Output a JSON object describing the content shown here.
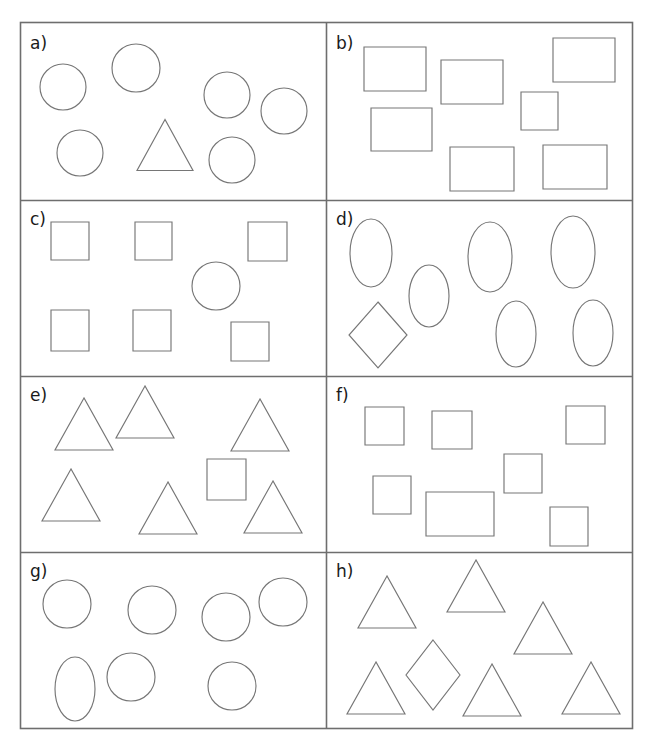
{
  "figure": {
    "title": "",
    "background_color": "#ffffff",
    "shape_stroke_color": "#767676",
    "frame_stroke_color": "#6e6e6e",
    "label_color": "#1a1a1a",
    "frame": {
      "x": 20,
      "y": 22,
      "width": 612,
      "height": 706
    },
    "dividers": {
      "vertical_x": [
        326
      ],
      "horizontal_y": [
        200,
        376,
        552
      ]
    }
  },
  "chart_data": {
    "type": "scatter",
    "title": "",
    "xlabel": "",
    "ylabel": "",
    "panels": [
      {
        "label": "a)",
        "label_pos": {
          "x": 30,
          "y": 49
        },
        "bounds": {
          "x": 20,
          "y": 22,
          "width": 306,
          "height": 178
        },
        "majority_shape": "circle",
        "majority_count": 6,
        "odd_shape": "triangle",
        "odd_count": 1,
        "shapes": [
          {
            "type": "circle",
            "cx": 63,
            "cy": 87,
            "r": 23
          },
          {
            "type": "circle",
            "cx": 136,
            "cy": 68,
            "r": 24
          },
          {
            "type": "circle",
            "cx": 227,
            "cy": 95,
            "r": 23
          },
          {
            "type": "circle",
            "cx": 284,
            "cy": 111,
            "r": 23
          },
          {
            "type": "circle",
            "cx": 80,
            "cy": 153,
            "r": 23
          },
          {
            "type": "circle",
            "cx": 232,
            "cy": 160,
            "r": 23
          },
          {
            "type": "triangle",
            "cx": 165,
            "cy": 145,
            "half_width": 28,
            "height": 51
          }
        ]
      },
      {
        "label": "b)",
        "label_pos": {
          "x": 336,
          "y": 49
        },
        "bounds": {
          "x": 326,
          "y": 22,
          "width": 306,
          "height": 178
        },
        "majority_shape": "rectangle",
        "majority_count": 6,
        "odd_shape": "square",
        "odd_count": 1,
        "shapes": [
          {
            "type": "rect",
            "x": 364,
            "y": 47,
            "width": 62,
            "height": 44
          },
          {
            "type": "rect",
            "x": 441,
            "y": 60,
            "width": 62,
            "height": 44
          },
          {
            "type": "rect",
            "x": 553,
            "y": 38,
            "width": 62,
            "height": 44
          },
          {
            "type": "rect",
            "x": 371,
            "y": 108,
            "width": 61,
            "height": 43
          },
          {
            "type": "rect",
            "x": 450,
            "y": 147,
            "width": 64,
            "height": 44
          },
          {
            "type": "rect",
            "x": 543,
            "y": 145,
            "width": 64,
            "height": 44
          },
          {
            "type": "rect",
            "x": 521,
            "y": 92,
            "width": 37,
            "height": 38
          }
        ]
      },
      {
        "label": "c)",
        "label_pos": {
          "x": 30,
          "y": 225
        },
        "bounds": {
          "x": 20,
          "y": 200,
          "width": 306,
          "height": 176
        },
        "majority_shape": "square",
        "majority_count": 6,
        "odd_shape": "circle",
        "odd_count": 1,
        "shapes": [
          {
            "type": "rect",
            "x": 51,
            "y": 222,
            "width": 38,
            "height": 38
          },
          {
            "type": "rect",
            "x": 135,
            "y": 222,
            "width": 37,
            "height": 38
          },
          {
            "type": "rect",
            "x": 248,
            "y": 222,
            "width": 39,
            "height": 39
          },
          {
            "type": "rect",
            "x": 51,
            "y": 310,
            "width": 38,
            "height": 41
          },
          {
            "type": "rect",
            "x": 133,
            "y": 310,
            "width": 38,
            "height": 41
          },
          {
            "type": "rect",
            "x": 231,
            "y": 322,
            "width": 38,
            "height": 39
          },
          {
            "type": "circle",
            "cx": 216,
            "cy": 286,
            "r": 24
          }
        ]
      },
      {
        "label": "d)",
        "label_pos": {
          "x": 336,
          "y": 225
        },
        "bounds": {
          "x": 326,
          "y": 200,
          "width": 306,
          "height": 176
        },
        "majority_shape": "ellipse",
        "majority_count": 6,
        "odd_shape": "diamond",
        "odd_count": 1,
        "shapes": [
          {
            "type": "ellipse",
            "cx": 371,
            "cy": 253,
            "rx": 21,
            "ry": 34
          },
          {
            "type": "ellipse",
            "cx": 429,
            "cy": 296,
            "rx": 20,
            "ry": 31
          },
          {
            "type": "ellipse",
            "cx": 490,
            "cy": 257,
            "rx": 22,
            "ry": 35
          },
          {
            "type": "ellipse",
            "cx": 573,
            "cy": 252,
            "rx": 22,
            "ry": 36
          },
          {
            "type": "ellipse",
            "cx": 516,
            "cy": 334,
            "rx": 20,
            "ry": 33
          },
          {
            "type": "ellipse",
            "cx": 593,
            "cy": 333,
            "rx": 20,
            "ry": 33
          },
          {
            "type": "diamond",
            "cx": 378,
            "cy": 335,
            "half_width": 29,
            "half_height": 33
          }
        ]
      },
      {
        "label": "e)",
        "label_pos": {
          "x": 30,
          "y": 401
        },
        "bounds": {
          "x": 20,
          "y": 376,
          "width": 306,
          "height": 176
        },
        "majority_shape": "triangle",
        "majority_count": 6,
        "odd_shape": "square",
        "odd_count": 1,
        "shapes": [
          {
            "type": "triangle",
            "cx": 84,
            "cy": 424,
            "half_width": 29,
            "height": 52
          },
          {
            "type": "triangle",
            "cx": 145,
            "cy": 412,
            "half_width": 29,
            "height": 52
          },
          {
            "type": "triangle",
            "cx": 260,
            "cy": 425,
            "half_width": 29,
            "height": 52
          },
          {
            "type": "triangle",
            "cx": 71,
            "cy": 495,
            "half_width": 29,
            "height": 52
          },
          {
            "type": "triangle",
            "cx": 168,
            "cy": 508,
            "half_width": 29,
            "height": 52
          },
          {
            "type": "triangle",
            "cx": 273,
            "cy": 507,
            "half_width": 29,
            "height": 52
          },
          {
            "type": "rect",
            "x": 207,
            "y": 459,
            "width": 39,
            "height": 41
          }
        ]
      },
      {
        "label": "f)",
        "label_pos": {
          "x": 336,
          "y": 401
        },
        "bounds": {
          "x": 326,
          "y": 376,
          "width": 306,
          "height": 176
        },
        "majority_shape": "square",
        "majority_count": 6,
        "odd_shape": "rectangle",
        "odd_count": 1,
        "shapes": [
          {
            "type": "rect",
            "x": 365,
            "y": 407,
            "width": 39,
            "height": 38
          },
          {
            "type": "rect",
            "x": 432,
            "y": 411,
            "width": 40,
            "height": 38
          },
          {
            "type": "rect",
            "x": 566,
            "y": 406,
            "width": 39,
            "height": 38
          },
          {
            "type": "rect",
            "x": 373,
            "y": 476,
            "width": 38,
            "height": 38
          },
          {
            "type": "rect",
            "x": 504,
            "y": 454,
            "width": 38,
            "height": 39
          },
          {
            "type": "rect",
            "x": 550,
            "y": 507,
            "width": 38,
            "height": 39
          },
          {
            "type": "rect",
            "x": 426,
            "y": 492,
            "width": 68,
            "height": 44
          }
        ]
      },
      {
        "label": "g)",
        "label_pos": {
          "x": 30,
          "y": 577
        },
        "bounds": {
          "x": 20,
          "y": 552,
          "width": 306,
          "height": 176
        },
        "majority_shape": "circle",
        "majority_count": 6,
        "odd_shape": "ellipse",
        "odd_count": 1,
        "shapes": [
          {
            "type": "circle",
            "cx": 67,
            "cy": 604,
            "r": 24
          },
          {
            "type": "circle",
            "cx": 152,
            "cy": 610,
            "r": 24
          },
          {
            "type": "circle",
            "cx": 226,
            "cy": 617,
            "r": 24
          },
          {
            "type": "circle",
            "cx": 283,
            "cy": 602,
            "r": 24
          },
          {
            "type": "circle",
            "cx": 131,
            "cy": 677,
            "r": 24
          },
          {
            "type": "circle",
            "cx": 232,
            "cy": 686,
            "r": 24
          },
          {
            "type": "ellipse",
            "cx": 75,
            "cy": 689,
            "rx": 20,
            "ry": 32
          }
        ]
      },
      {
        "label": "h)",
        "label_pos": {
          "x": 336,
          "y": 577
        },
        "bounds": {
          "x": 326,
          "y": 552,
          "width": 306,
          "height": 176
        },
        "majority_shape": "triangle",
        "majority_count": 6,
        "odd_shape": "diamond",
        "odd_count": 1,
        "shapes": [
          {
            "type": "triangle",
            "cx": 387,
            "cy": 602,
            "half_width": 29,
            "height": 52
          },
          {
            "type": "triangle",
            "cx": 476,
            "cy": 586,
            "half_width": 29,
            "height": 52
          },
          {
            "type": "triangle",
            "cx": 543,
            "cy": 628,
            "half_width": 29,
            "height": 52
          },
          {
            "type": "triangle",
            "cx": 376,
            "cy": 688,
            "half_width": 29,
            "height": 52
          },
          {
            "type": "triangle",
            "cx": 492,
            "cy": 690,
            "half_width": 29,
            "height": 52
          },
          {
            "type": "triangle",
            "cx": 591,
            "cy": 688,
            "half_width": 29,
            "height": 52
          },
          {
            "type": "diamond",
            "cx": 433,
            "cy": 675,
            "half_width": 27,
            "half_height": 35
          }
        ]
      }
    ]
  }
}
